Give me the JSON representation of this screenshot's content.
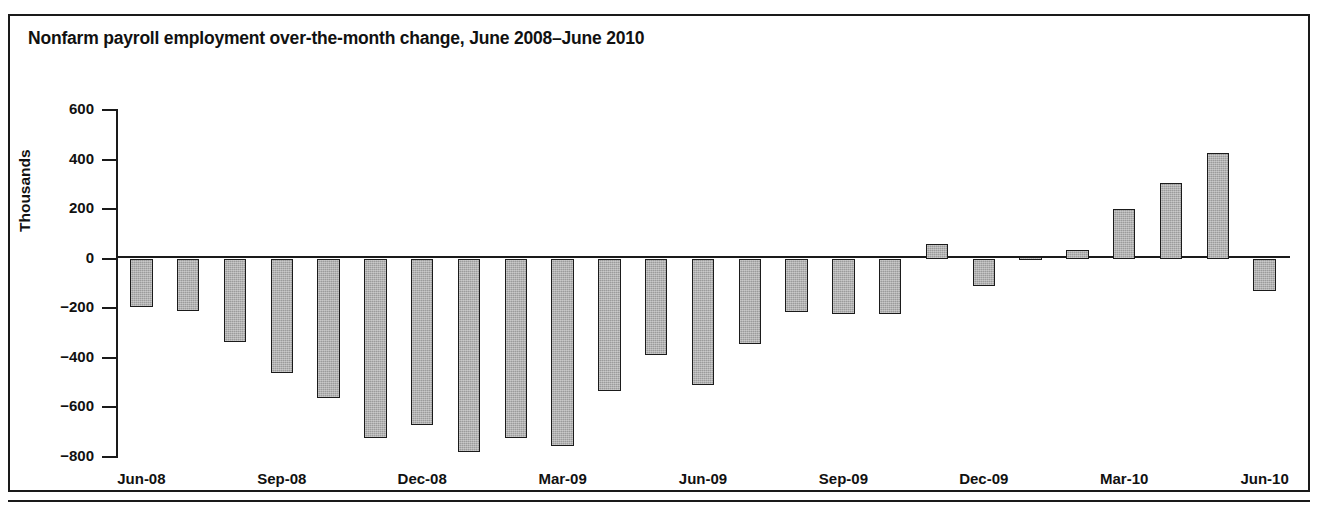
{
  "figure": {
    "title": "Nonfarm payroll employment over-the-month change, June 2008–June 2010",
    "frame_color": "#1a1a1a",
    "bar_fill_color": "#9b9b9b",
    "bar_edge_color": "#1b1b1b"
  },
  "chart_data": {
    "type": "bar",
    "title": "Nonfarm payroll employment over-the-month change, June 2008–June 2010",
    "xlabel": "",
    "ylabel": "Thousands",
    "ylim": [
      -800,
      600
    ],
    "yticks": [
      600,
      400,
      200,
      0,
      -200,
      -400,
      -600,
      -800
    ],
    "ytick_labels": [
      "600",
      "400",
      "200",
      "0",
      "−200",
      "−400",
      "−600",
      "−800"
    ],
    "grid": false,
    "legend": null,
    "categories": [
      "Jun-08",
      "Jul-08",
      "Aug-08",
      "Sep-08",
      "Oct-08",
      "Nov-08",
      "Dec-08",
      "Jan-09",
      "Feb-09",
      "Mar-09",
      "Apr-09",
      "May-09",
      "Jun-09",
      "Jul-09",
      "Aug-09",
      "Sep-09",
      "Oct-09",
      "Nov-09",
      "Dec-09",
      "Jan-10",
      "Feb-10",
      "Mar-10",
      "Apr-10",
      "May-10",
      "Jun-10"
    ],
    "xtick_labels": [
      "Jun-08",
      "Sep-08",
      "Dec-08",
      "Mar-09",
      "Jun-09",
      "Sep-09",
      "Dec-09",
      "Mar-10",
      "Jun-10"
    ],
    "xtick_categories": [
      "Jun-08",
      "Sep-08",
      "Dec-08",
      "Mar-09",
      "Jun-09",
      "Sep-09",
      "Dec-09",
      "Mar-10",
      "Jun-10"
    ],
    "values": [
      -193,
      -210,
      -335,
      -462,
      -560,
      -725,
      -670,
      -780,
      -725,
      -755,
      -535,
      -390,
      -510,
      -345,
      -215,
      -225,
      -225,
      60,
      -110,
      8,
      35,
      200,
      305,
      425,
      -130
    ]
  }
}
